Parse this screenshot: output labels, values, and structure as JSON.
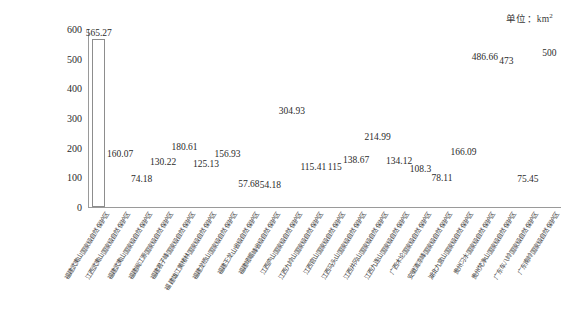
{
  "unit_note": {
    "prefix": "单位：km",
    "superscript": "2"
  },
  "chart_data": {
    "type": "bar",
    "title": "",
    "subtitle": "",
    "xlabel": "",
    "ylabel": "",
    "unit": "km²",
    "ylim": [
      0,
      600
    ],
    "yticks": [
      0,
      100,
      200,
      300,
      400,
      500,
      600
    ],
    "ytick_labels": [
      "0",
      "100",
      "200",
      "300",
      "400",
      "500",
      "600"
    ],
    "grid": false,
    "legend": "none",
    "bar_style": "white-fill-outline",
    "categories": [
      "福建武夷山国家级自然保护区",
      "江西武夷山国家级自然保护区",
      "福建武夷山国家级自然保护区",
      "福建闽江源国家级自然保护区",
      "福建君子峰国家级自然保护区",
      "福建雄江黄楮林国家级自然保护区",
      "福建龙栖山国家级自然保护区",
      "福建王龙山省级自然保护区",
      "福建峨嵋峰省级自然保护区",
      "江西庐山国家级自然保护区",
      "江西九岭山国家级自然保护区",
      "江西官山国家级自然保护区",
      "江西马头山国家级自然保护区",
      "江西井冈山国家级自然保护区",
      "江西九连山国家级自然保护区",
      "广西木论国家级自然保护区",
      "安徽清凉峰国家级自然保护区",
      "湖北九宫山国家级自然保护区",
      "贵州习水国家级自然保护区",
      "贵州梵净山国家级自然保护区",
      "广东车八岭国家级自然保护区",
      "广东南岭国家级自然保护区"
    ],
    "values": [
      565.27,
      160.07,
      74.18,
      130.22,
      180.61,
      125.13,
      156.93,
      57.68,
      54.18,
      304.93,
      115.41,
      115,
      138.67,
      214.99,
      134.12,
      108.3,
      78.11,
      166.09,
      486.66,
      473,
      75.45,
      500
    ],
    "value_labels": [
      "565.27",
      "160.07",
      "74.18",
      "130.22",
      "180.61",
      "125.13",
      "156.93",
      "57.68",
      "54.18",
      "304.93",
      "115.41",
      "115",
      "138.67",
      "214.99",
      "134.12",
      "108.3",
      "78.11",
      "166.09",
      "486.66",
      "473",
      "75.45",
      "500"
    ]
  }
}
